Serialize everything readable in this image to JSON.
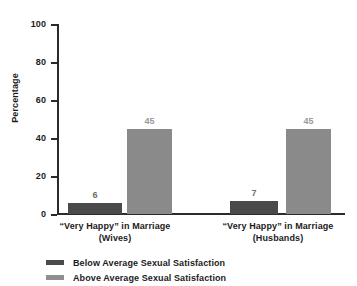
{
  "chart_data": {
    "type": "bar",
    "title": "",
    "xlabel": "",
    "ylabel": "Percentage",
    "ylim": [
      0,
      100
    ],
    "yticks": [
      0,
      20,
      40,
      60,
      80,
      100
    ],
    "ytick_labels": [
      "0",
      "20",
      "40",
      "60",
      "80",
      "100"
    ],
    "grid": false,
    "legend_position": "bottom-left",
    "categories": [
      "“Very Happy” in Marriage (Wives)",
      "“Very Happy” in Marriage (Husbands)"
    ],
    "category_lines": [
      {
        "line1": "“Very Happy” in Marriage",
        "line2": "(Wives)"
      },
      {
        "line1": "“Very Happy” in Marriage",
        "line2": "(Husbands)"
      }
    ],
    "series": [
      {
        "name": "Below Average Sexual Satisfaction",
        "color": "#4a4a4a",
        "values": [
          6,
          7
        ],
        "value_labels": [
          "6",
          "7"
        ]
      },
      {
        "name": "Above Average Sexual Satisfaction",
        "color": "#8a8a8a",
        "values": [
          45,
          45
        ],
        "value_labels": [
          "45",
          "45"
        ]
      }
    ]
  },
  "axis": {
    "y_title": "Percentage",
    "ticks": [
      {
        "label": "100",
        "value": 100
      },
      {
        "label": "80",
        "value": 80
      },
      {
        "label": "60",
        "value": 60
      },
      {
        "label": "40",
        "value": 40
      },
      {
        "label": "20",
        "value": 20
      },
      {
        "label": "0",
        "value": 0
      }
    ]
  },
  "legend": {
    "items": [
      {
        "label": "Below Average Sexual Satisfaction",
        "color": "#4a4a4a"
      },
      {
        "label": "Above Average Sexual Satisfaction",
        "color": "#8f8f8f"
      }
    ]
  },
  "colors": {
    "below_average": "#4a4a4a",
    "above_average": "#8a8a8a",
    "axis": "#2b2b2b",
    "text": "#1c1c1c",
    "value_label_dark": "#6d6d6d",
    "value_label_light": "#9a9a9a",
    "background": "#ffffff"
  }
}
